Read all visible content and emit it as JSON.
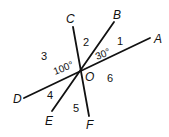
{
  "diagram": {
    "center_label": "O",
    "lines": [
      {
        "name": "AD",
        "ends": [
          "A",
          "D"
        ]
      },
      {
        "name": "BE",
        "ends": [
          "B",
          "E"
        ]
      },
      {
        "name": "CF",
        "ends": [
          "C",
          "F"
        ]
      }
    ],
    "point_labels": {
      "A": "A",
      "B": "B",
      "C": "C",
      "D": "D",
      "E": "E",
      "F": "F",
      "O": "O"
    },
    "angle_numbers": {
      "a1": "1",
      "a2": "2",
      "a3": "3",
      "a4": "4",
      "a5": "5",
      "a6": "6"
    },
    "angle_measures": {
      "aob": "30°",
      "doc": "100°"
    }
  }
}
